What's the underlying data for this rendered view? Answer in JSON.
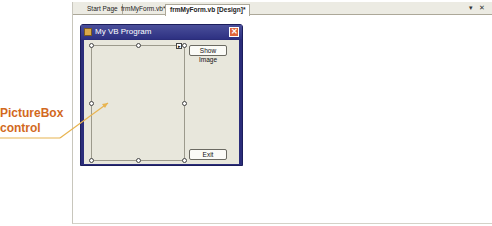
{
  "ide": {
    "tabs": [
      {
        "label": "Start Page",
        "active": false
      },
      {
        "label": "frmMyForm.vb*",
        "active": false
      },
      {
        "label": "frmMyForm.vb [Design]*",
        "active": true
      }
    ],
    "tab_controls": {
      "dropdown": "▾",
      "close": "✕"
    }
  },
  "form": {
    "title": "My VB Program",
    "close_glyph": "✕",
    "buttons": {
      "show_image": "Show Image",
      "exit": "Exit"
    }
  },
  "callout": {
    "line1": "PictureBox",
    "line2": "control",
    "color": "#d2691e",
    "leader_color": "#e8b450"
  }
}
